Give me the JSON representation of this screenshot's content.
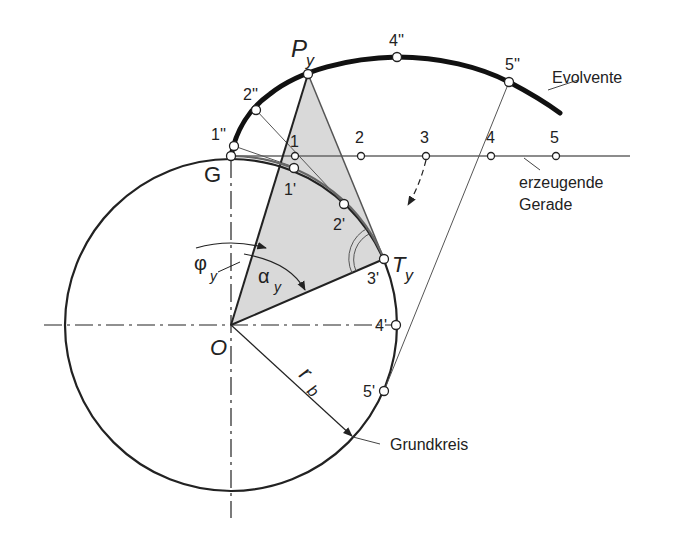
{
  "diagram": {
    "colors": {
      "line": "#222222",
      "thin_line": "#555555",
      "triangle_fill": "#d9d9d9",
      "background": "#ffffff"
    },
    "labels": {
      "evolvente": "Evolvente",
      "erzeugende_1": "erzeugende",
      "erzeugende_2": "Gerade",
      "grundkreis": "Grundkreis",
      "G": "G",
      "O": "O",
      "P": "P",
      "P_sub": "y",
      "T": "T",
      "T_sub": "y",
      "phi": "φ",
      "phi_sub": "y",
      "alpha": "α",
      "alpha_sub": "y",
      "r": "r",
      "r_sub": "b"
    },
    "line_points": [
      "1",
      "2",
      "3",
      "4",
      "5"
    ],
    "circle_points": [
      "1'",
      "2'",
      "3'",
      "4'",
      "5'"
    ],
    "involute_points": [
      "1''",
      "2''",
      "4''",
      "5''"
    ]
  }
}
